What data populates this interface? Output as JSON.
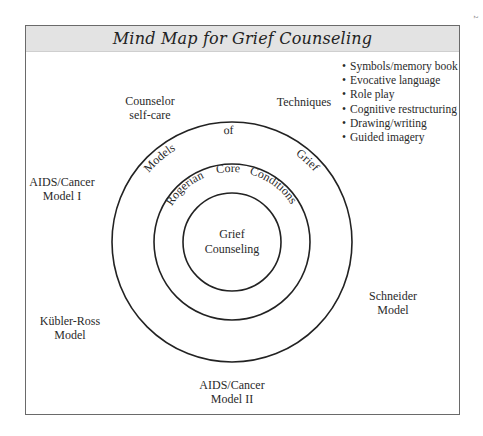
{
  "title": "Mind Map for Grief Counseling",
  "page_mark": "2",
  "center": {
    "line1": "Grief",
    "line2": "Counseling"
  },
  "middle_ring_text": [
    "Rogerian",
    "Core",
    "Conditions"
  ],
  "outer_ring_text": [
    "Models",
    "of",
    "Grief"
  ],
  "nodes": {
    "counselor_self_care": {
      "line1": "Counselor",
      "line2": "self-care"
    },
    "techniques": {
      "label": "Techniques"
    },
    "aids_cancer_model_1": {
      "line1": "AIDS/Cancer",
      "line2": "Model I"
    },
    "kubler_ross_model": {
      "line1": "Kübler-Ross",
      "line2": "Model"
    },
    "aids_cancer_model_2": {
      "line1": "AIDS/Cancer",
      "line2": "Model II"
    },
    "schneider_model": {
      "line1": "Schneider",
      "line2": "Model"
    }
  },
  "techniques_list": [
    "Symbols/memory book",
    "Evocative language",
    "Role play",
    "Cognitive restructuring",
    "Drawing/writing",
    "Guided imagery"
  ],
  "colors": {
    "header_bg": "#e3e3e3",
    "stroke": "#222222",
    "frame": "#6a6a6a"
  }
}
